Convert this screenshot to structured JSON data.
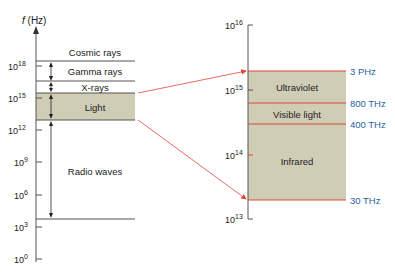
{
  "left_scale": {
    "axis_label": "f (Hz)",
    "ticks": [
      {
        "base": "10",
        "exp": "18",
        "y": 66
      },
      {
        "base": "10",
        "exp": "15",
        "y": 98
      },
      {
        "base": "10",
        "exp": "12",
        "y": 130
      },
      {
        "base": "10",
        "exp": "9",
        "y": 162
      },
      {
        "base": "10",
        "exp": "6",
        "y": 195
      },
      {
        "base": "10",
        "exp": "3",
        "y": 227
      },
      {
        "base": "10",
        "exp": "0",
        "y": 259
      }
    ],
    "bands": [
      {
        "label": "Cosmic rays"
      },
      {
        "label": "Gamma rays"
      },
      {
        "label": "X-rays"
      },
      {
        "label": "Light"
      },
      {
        "label": "Radio waves"
      }
    ]
  },
  "right_scale": {
    "ticks": [
      {
        "base": "10",
        "exp": "16",
        "y": 25
      },
      {
        "base": "10",
        "exp": "15",
        "y": 90
      },
      {
        "base": "10",
        "exp": "14",
        "y": 155
      },
      {
        "base": "10",
        "exp": "13",
        "y": 219
      }
    ],
    "bands": [
      {
        "label": "Ultraviolet"
      },
      {
        "label": "Visible light"
      },
      {
        "label": "Infrared"
      }
    ],
    "boundaries": [
      {
        "label": "3 PHz"
      },
      {
        "label": "800 THz"
      },
      {
        "label": "400 THz"
      },
      {
        "label": "30 THz"
      }
    ]
  },
  "colors": {
    "band_fill": "#cfcdb5",
    "red_line": "#e0453a",
    "blue_text": "#2a5f9e",
    "axis": "#555555"
  }
}
